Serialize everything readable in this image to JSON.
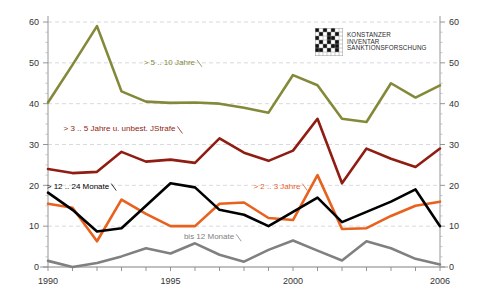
{
  "logo": {
    "name": "konstanzer-inventar-sanktionsforschung-logo",
    "line1": "Konstanzer",
    "line2": "Inventar",
    "line3": "Sanktionsforschung"
  },
  "chart_data": {
    "type": "line",
    "title": "",
    "subtitle": "",
    "xlabel": "",
    "ylabel": "",
    "xlim": [
      1990,
      2006
    ],
    "ylim": [
      0,
      60
    ],
    "ytick_step": 10,
    "yticks": [
      0,
      10,
      20,
      30,
      40,
      50,
      60
    ],
    "ytick_labels": [
      "0",
      "10",
      "20",
      "30",
      "40",
      "50",
      "60"
    ],
    "y_axis_right": true,
    "y_axis_right_labels": [
      "0",
      "10",
      "20",
      "30",
      "40",
      "50",
      "60"
    ],
    "grid": "horizontal-dashed",
    "legend_position": "inline-annotations",
    "x": [
      1990,
      1991,
      1992,
      1993,
      1994,
      1995,
      1996,
      1997,
      1998,
      1999,
      2000,
      2001,
      2002,
      2003,
      2004,
      2005,
      2006
    ],
    "xticks": [
      1990,
      1991,
      1992,
      1993,
      1994,
      1995,
      1996,
      1997,
      1998,
      1999,
      2000,
      2001,
      2002,
      2003,
      2004,
      2005,
      2006
    ],
    "xtick_labels_shown": [
      "1990",
      "1995",
      "2000",
      "2006"
    ],
    "xtick_labels_shown_values": [
      1990,
      1995,
      2000,
      2006
    ],
    "series": [
      {
        "name": "> 5 .. 10 Jahre",
        "label": "> 5 .. 10 Jahre",
        "color": "#84893a",
        "values": [
          40.3,
          49.5,
          59.0,
          43.0,
          40.5,
          40.2,
          40.3,
          40.0,
          39.0,
          37.8,
          47.0,
          44.5,
          36.3,
          35.5,
          45.0,
          41.5,
          44.5
        ]
      },
      {
        "name": "> 3 .. 5 Jahre u. unbest. JStrafe",
        "label": "> 3 .. 5 Jahre u. unbest. JStrafe",
        "color": "#8f1d12",
        "values": [
          24.0,
          23.0,
          23.3,
          28.2,
          25.8,
          26.3,
          25.5,
          31.5,
          28.0,
          26.0,
          28.5,
          36.3,
          20.5,
          29.0,
          26.5,
          24.5,
          29.0
        ]
      },
      {
        "name": "> 2 .. 3 Jahre",
        "label": "> 2 .. 3 Jahre",
        "color": "#e8611d",
        "values": [
          15.5,
          14.5,
          6.3,
          16.5,
          13.0,
          10.0,
          10.0,
          15.5,
          15.8,
          12.0,
          11.5,
          22.5,
          9.3,
          9.5,
          12.5,
          15.0,
          16.0
        ]
      },
      {
        "name": "> 12 .. 24 Monate",
        "label": "> 12 .. 24 Monate",
        "color": "#000000",
        "values": [
          18.2,
          14.0,
          8.7,
          9.5,
          15.0,
          20.5,
          19.5,
          14.0,
          12.8,
          10.0,
          13.5,
          17.0,
          11.0,
          13.5,
          16.0,
          19.0,
          10.0
        ]
      },
      {
        "name": "bis 12 Monate",
        "label": "bis  12 Monate",
        "color": "#808080",
        "values": [
          1.5,
          0.0,
          1.0,
          2.6,
          4.6,
          3.3,
          5.8,
          3.0,
          1.3,
          4.2,
          6.5,
          4.0,
          1.6,
          6.3,
          4.6,
          2.0,
          0.6
        ]
      }
    ],
    "annotations": [
      {
        "text": "> 5 .. 10 Jahre",
        "color": "#84893a",
        "x": 1996.0,
        "y": 49.5
      },
      {
        "text": "> 3 .. 5 Jahre u. unbest. JStrafe",
        "color": "#8f1d12",
        "x": 1995.2,
        "y": 33.2
      },
      {
        "text": "> 2 .. 3 Jahre",
        "color": "#e8611d",
        "x": 2000.3,
        "y": 19.2
      },
      {
        "text": "> 12 .. 24 Monate",
        "color": "#000000",
        "x": 1992.5,
        "y": 19.2
      },
      {
        "text": "bis  12 Monate",
        "color": "#808080",
        "x": 1997.6,
        "y": 6.8
      }
    ]
  }
}
